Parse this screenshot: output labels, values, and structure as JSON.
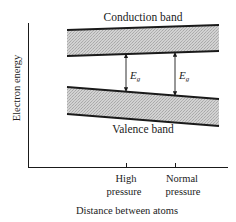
{
  "diagram": {
    "type": "band-energy-diagram",
    "y_axis_label": "Electron energy",
    "x_axis_label": "Distance between atoms",
    "bands": {
      "conduction": {
        "label": "Conduction band"
      },
      "valence": {
        "label": "Valence band"
      }
    },
    "gap_labels": [
      {
        "main": "E",
        "sub": "g"
      },
      {
        "main": "E",
        "sub": "g"
      }
    ],
    "ticks": [
      {
        "line1": "High",
        "line2": "pressure"
      },
      {
        "line1": "Normal",
        "line2": "pressure"
      }
    ],
    "colors": {
      "line": "#1a1a1a",
      "band_fill": "#c8c8c8"
    }
  }
}
